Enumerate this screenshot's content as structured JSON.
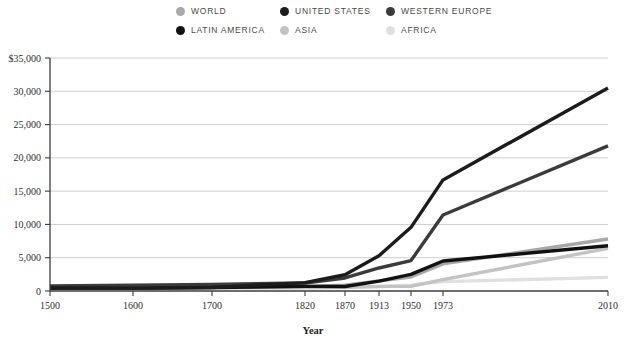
{
  "legend": {
    "items": [
      {
        "label": "WORLD",
        "color": "#a8a8a8"
      },
      {
        "label": "UNITED STATES",
        "color": "#1c1c1c"
      },
      {
        "label": "WESTERN EUROPE",
        "color": "#3b3b3b"
      },
      {
        "label": "LATIN AMERICA",
        "color": "#111111"
      },
      {
        "label": "ASIA",
        "color": "#c3c3c3"
      },
      {
        "label": "AFRICA",
        "color": "#e0e0e0"
      }
    ]
  },
  "chart_data": {
    "type": "line",
    "title": "",
    "xlabel": "Year",
    "ylabel": "",
    "x": [
      "1500",
      "1600",
      "1700",
      "1820",
      "1870",
      "1913",
      "1950",
      "1973",
      "2010"
    ],
    "x_positions": [
      50,
      133,
      212,
      305,
      345,
      379,
      411,
      443,
      608
    ],
    "ylim": [
      0,
      35000
    ],
    "yticks": [
      0,
      5000,
      10000,
      15000,
      20000,
      25000,
      30000,
      35000
    ],
    "ytick_labels": [
      "0",
      "5,000",
      "10,000",
      "15,000",
      "20,000",
      "25,000",
      "30,000",
      "$35,000"
    ],
    "grid": true,
    "legend_position": "top",
    "series": [
      {
        "name": "WORLD",
        "color": "#a8a8a8",
        "width": 3.4,
        "values": [
          550,
          600,
          615,
          670,
          870,
          1520,
          2110,
          4080,
          7810
        ]
      },
      {
        "name": "UNITED STATES",
        "color": "#1c1c1c",
        "width": 3.4,
        "values": [
          400,
          400,
          527,
          1257,
          2445,
          5301,
          9561,
          16689,
          30500
        ]
      },
      {
        "name": "WESTERN EUROPE",
        "color": "#3b3b3b",
        "width": 3.4,
        "values": [
          771,
          890,
          998,
          1202,
          1960,
          3457,
          4569,
          11417,
          21800
        ]
      },
      {
        "name": "LATIN AMERICA",
        "color": "#111111",
        "width": 3.4,
        "values": [
          416,
          438,
          527,
          691,
          676,
          1481,
          2506,
          4504,
          6800
        ]
      },
      {
        "name": "ASIA",
        "color": "#c3c3c3",
        "width": 3.4,
        "values": [
          572,
          576,
          572,
          577,
          556,
          696,
          717,
          1718,
          6400
        ]
      },
      {
        "name": "AFRICA",
        "color": "#e0e0e0",
        "width": 3.4,
        "values": [
          414,
          422,
          421,
          420,
          500,
          637,
          890,
          1410,
          2050
        ]
      }
    ]
  },
  "plot_geometry": {
    "left": 50,
    "right": 608,
    "top": 58,
    "bottom": 291
  }
}
